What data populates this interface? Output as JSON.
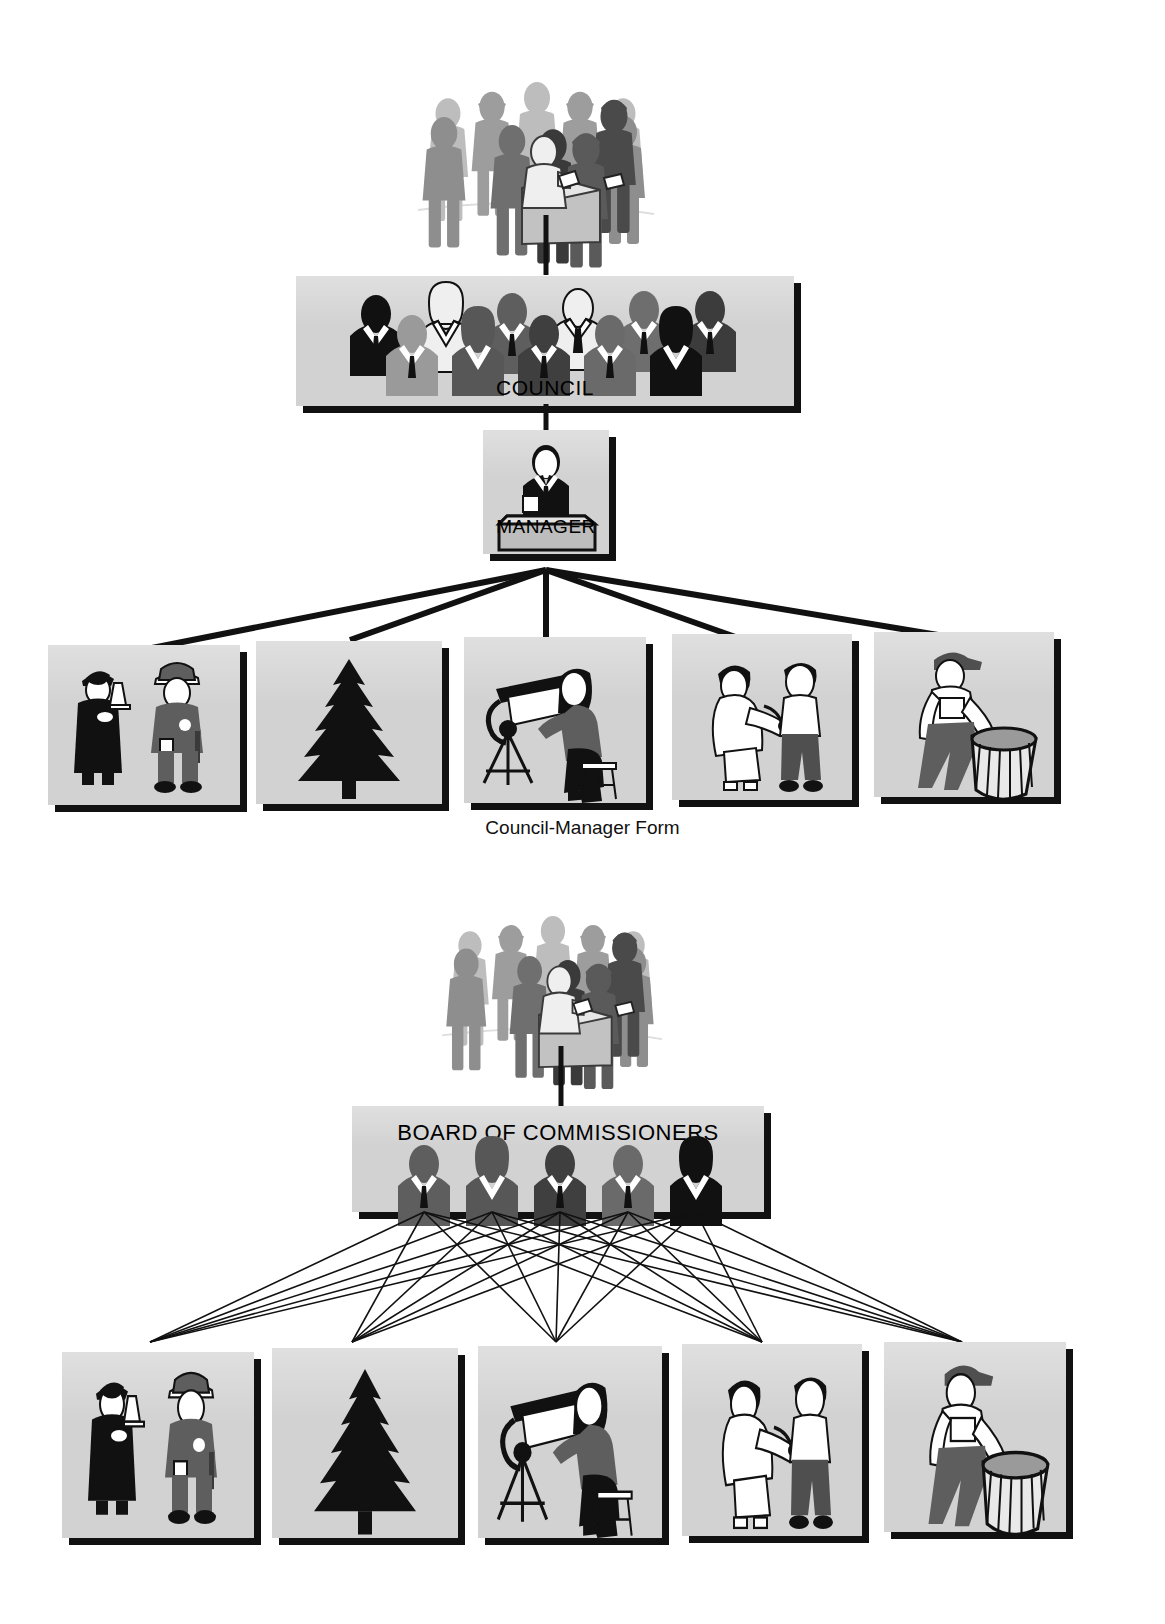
{
  "document": {
    "title": "Forms of Local Government",
    "bg_color": "#ffffff",
    "panel_fill": "#d2d2d2",
    "shadow_color": "#111111",
    "ink": "#000000"
  },
  "diagrams": [
    {
      "id": "council-manager",
      "caption": "Council-Manager Form",
      "nodes": {
        "voters": {
          "label": "",
          "icon": "crowd-of-voters-icon",
          "description": "citizens at a ballot box"
        },
        "council": {
          "label": "COUNCIL",
          "icon": "council-members-icon",
          "member_count": 11
        },
        "manager": {
          "label": "MANAGER",
          "icon": "manager-at-desk-icon"
        }
      },
      "departments": [
        {
          "label": "",
          "icon": "judge-and-police-officer-icon",
          "name": "public-safety-department"
        },
        {
          "label": "",
          "icon": "evergreen-tree-icon",
          "name": "parks-department"
        },
        {
          "label": "",
          "icon": "drafter-at-drawing-board-icon",
          "name": "engineering-department"
        },
        {
          "label": "",
          "icon": "nurse-examining-patient-icon",
          "name": "health-department"
        },
        {
          "label": "",
          "icon": "sanitation-worker-with-trash-can-icon",
          "name": "sanitation-department"
        }
      ],
      "connections": "manager-to-each-department (single fan from one point)"
    },
    {
      "id": "commission",
      "caption": "",
      "nodes": {
        "voters": {
          "label": "",
          "icon": "crowd-of-voters-icon",
          "description": "citizens at a ballot box"
        },
        "board": {
          "label": "BOARD OF COMMISSIONERS",
          "icon": "commissioner-busts-icon",
          "member_count": 5
        }
      },
      "departments": [
        {
          "label": "",
          "icon": "judge-and-police-officer-icon",
          "name": "public-safety-department"
        },
        {
          "label": "",
          "icon": "evergreen-tree-icon",
          "name": "parks-department"
        },
        {
          "label": "",
          "icon": "drafter-at-drawing-board-icon",
          "name": "engineering-department"
        },
        {
          "label": "",
          "icon": "nurse-examining-patient-icon",
          "name": "health-department"
        },
        {
          "label": "",
          "icon": "sanitation-worker-with-trash-can-icon",
          "name": "sanitation-department"
        }
      ],
      "connections": "each-commissioner-to-each-department (full mesh, 25 thin lines)"
    }
  ]
}
